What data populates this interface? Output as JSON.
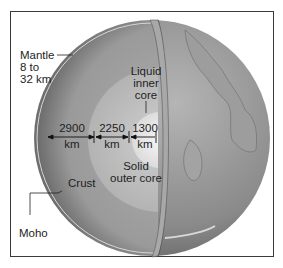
{
  "diagram": {
    "title_fragment": "",
    "labels": {
      "mantle": {
        "line1": "Mantle",
        "line2": "8 to",
        "line3": "32 km"
      },
      "liquid_inner_core": {
        "line1": "Liquid",
        "line2": "inner",
        "line3": "core"
      },
      "dist1": {
        "value": "2900",
        "unit": "km"
      },
      "dist2": {
        "value": "2250",
        "unit": "km"
      },
      "dist3": {
        "value": "1300",
        "unit": "km"
      },
      "solid_outer_core": {
        "line1": "Solid",
        "line2": "outer core"
      },
      "crust": "Crust",
      "moho": "Moho"
    },
    "colors": {
      "frame": "#3a3a3a",
      "mantle": "#9a9a9a",
      "outer_core": "#bdbdbd",
      "inner_core": "#e6e6e6",
      "globe_surface": "#8c8c8c"
    }
  }
}
